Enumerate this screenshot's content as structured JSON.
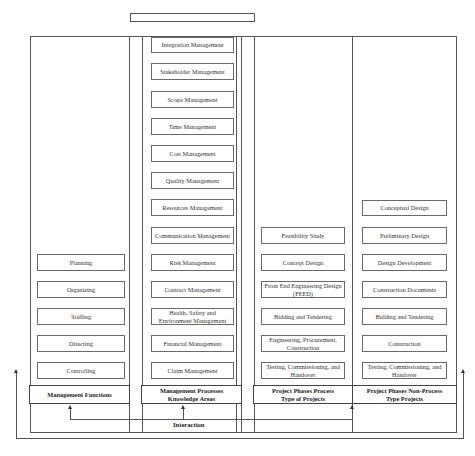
{
  "diagram": {
    "title_box": "",
    "columns": [
      {
        "header": "Management Functions",
        "items": [
          "Planning",
          "Organizing",
          "Staffing",
          "Directing",
          "Controlling"
        ]
      },
      {
        "header": "Management Processes\nKnowledge Areas",
        "items": [
          "Integration Management",
          "Stakeholder Management",
          "Scope Management",
          "Time Management",
          "Cost Management",
          "Quality Management",
          "Resources Management",
          "Communication Management",
          "Risk Management",
          "Contract Management",
          "Health, Safety and Environment Management",
          "Financial Management",
          "Claim Management"
        ]
      },
      {
        "header": "Project Phases Process\nType of Projects",
        "items": [
          "Feasibility Study",
          "Concept Design",
          "Front End Engineering Design (FEED)",
          "Bidding and Tendering",
          "Engineering, Procurement, Construction",
          "Testing, Commissioning, and Handover"
        ]
      },
      {
        "header": "Project Phases Non-Process\nType Projects",
        "items": [
          "Conceptual Design",
          "Preliminary Design",
          "Design Development",
          "Construction Documents",
          "Bidding and Tendering",
          "Construction",
          "Testing, Commissioning, and Handover"
        ]
      }
    ],
    "interaction_label": "Interaction",
    "colors": {
      "line": "#555555",
      "box_border": "#6a6a6a",
      "text": "#333333",
      "background": "#ffffff"
    }
  }
}
